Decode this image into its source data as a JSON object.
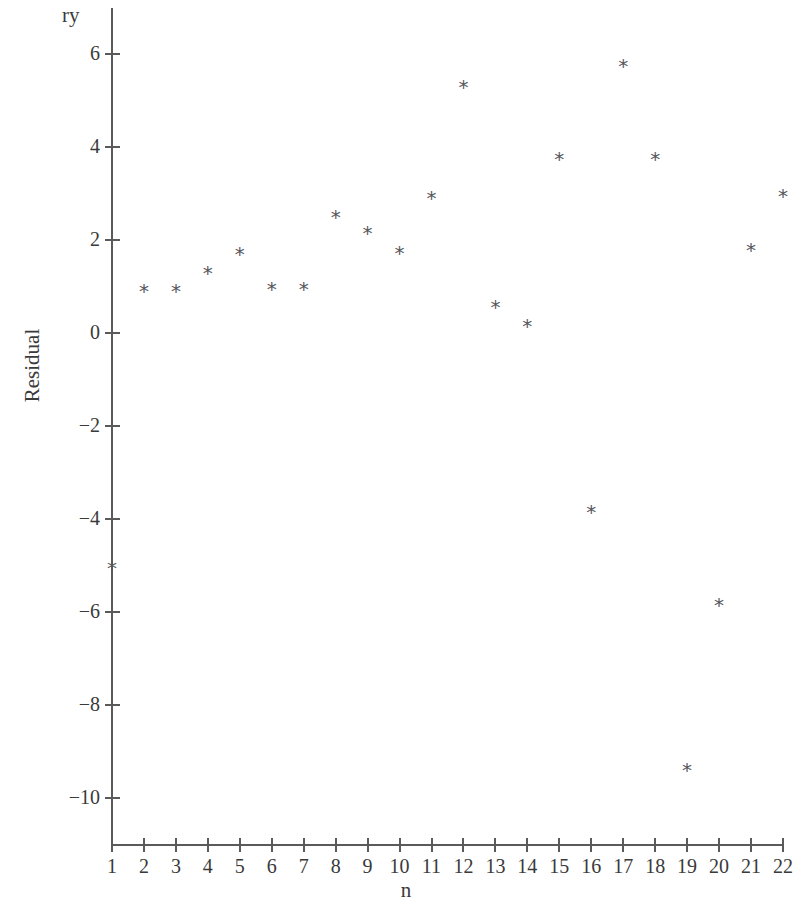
{
  "chart_data": {
    "type": "scatter",
    "title": "",
    "xlabel": "n",
    "ylabel": "Residual",
    "y_axis_top_label": "ry",
    "marker": "*",
    "marker_color": "#57575c",
    "axis_color": "#5a5a5a",
    "grid": false,
    "legend": null,
    "xlim": [
      0.5,
      22.5
    ],
    "ylim": [
      -10.8,
      6.6
    ],
    "x_ticks": [
      1,
      2,
      3,
      4,
      5,
      6,
      7,
      8,
      9,
      10,
      11,
      12,
      13,
      14,
      15,
      16,
      17,
      18,
      19,
      20,
      21,
      22
    ],
    "x_tick_labels": [
      "1",
      "2",
      "3",
      "4",
      "5",
      "6",
      "7",
      "8",
      "9",
      "10",
      "11",
      "12",
      "13",
      "14",
      "15",
      "16",
      "17",
      "18",
      "19",
      "20",
      "21",
      "22"
    ],
    "y_ticks": [
      6,
      4,
      2,
      0,
      -2,
      -4,
      -6,
      -8,
      -10
    ],
    "y_tick_labels": [
      "6",
      "4",
      "2",
      "0",
      "−2",
      "−4",
      "−6",
      "−8",
      "−10"
    ],
    "x": [
      1,
      2,
      3,
      4,
      5,
      6,
      7,
      8,
      9,
      10,
      11,
      12,
      13,
      14,
      15,
      16,
      17,
      18,
      19,
      20,
      21,
      22
    ],
    "values": [
      -5.05,
      0.9,
      0.9,
      1.3,
      1.7,
      0.95,
      0.95,
      2.5,
      2.15,
      1.72,
      2.9,
      5.3,
      0.55,
      0.15,
      3.75,
      -3.85,
      5.75,
      3.75,
      -9.4,
      -5.85,
      1.78,
      2.95
    ],
    "points": [
      {
        "n": 1,
        "residual": -5.05
      },
      {
        "n": 2,
        "residual": 0.9
      },
      {
        "n": 3,
        "residual": 0.9
      },
      {
        "n": 4,
        "residual": 1.3
      },
      {
        "n": 5,
        "residual": 1.7
      },
      {
        "n": 6,
        "residual": 0.95
      },
      {
        "n": 7,
        "residual": 0.95
      },
      {
        "n": 8,
        "residual": 2.5
      },
      {
        "n": 9,
        "residual": 2.15
      },
      {
        "n": 10,
        "residual": 1.72
      },
      {
        "n": 11,
        "residual": 2.9
      },
      {
        "n": 12,
        "residual": 5.3
      },
      {
        "n": 13,
        "residual": 0.55
      },
      {
        "n": 14,
        "residual": 0.15
      },
      {
        "n": 15,
        "residual": 3.75
      },
      {
        "n": 16,
        "residual": -3.85
      },
      {
        "n": 17,
        "residual": 5.75
      },
      {
        "n": 18,
        "residual": 3.75
      },
      {
        "n": 19,
        "residual": -9.4
      },
      {
        "n": 20,
        "residual": -5.85
      },
      {
        "n": 21,
        "residual": 1.78
      },
      {
        "n": 22,
        "residual": 2.95
      }
    ]
  }
}
